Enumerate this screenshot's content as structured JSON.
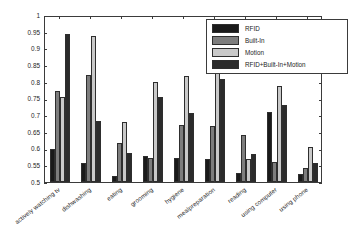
{
  "chart_data": {
    "type": "bar",
    "title": "",
    "xlabel": "",
    "ylabel": "Average ROC Area",
    "ylim": [
      0.5,
      1.0
    ],
    "yticks": [
      "0.5",
      "0.55",
      "0.6",
      "0.65",
      "0.7",
      "0.75",
      "0.8",
      "0.85",
      "0.9",
      "0.95",
      "1"
    ],
    "grid": false,
    "legend_position": "top-right",
    "categories": [
      "actively watching tv",
      "dishwashing",
      "eating",
      "grooming",
      "hygiene",
      "mealpreparation",
      "reading",
      "using computer",
      "using phone"
    ],
    "series": [
      {
        "name": "RFID",
        "color": "#1a1a1a",
        "values": [
          0.6,
          0.557,
          0.518,
          0.578,
          0.573,
          0.568,
          0.526,
          0.71,
          0.523
        ]
      },
      {
        "name": "Built-In",
        "color": "#7d7d7d",
        "values": [
          0.773,
          0.82,
          0.617,
          0.571,
          0.672,
          0.668,
          0.64,
          0.559,
          0.543
        ]
      },
      {
        "name": "Motion",
        "color": "#c9c9c9",
        "values": [
          0.755,
          0.937,
          0.681,
          0.798,
          0.817,
          0.89,
          0.569,
          0.788,
          0.604
        ]
      },
      {
        "name": "RFID+Built-In+Motion",
        "color": "#2b2b2b",
        "values": [
          0.944,
          0.684,
          0.588,
          0.754,
          0.708,
          0.807,
          0.583,
          0.731,
          0.556
        ]
      }
    ]
  },
  "legend": {
    "items": [
      {
        "label": "RFID"
      },
      {
        "label": "Built-In"
      },
      {
        "label": "Motion"
      },
      {
        "label": "RFID+Built-In+Motion"
      }
    ]
  }
}
